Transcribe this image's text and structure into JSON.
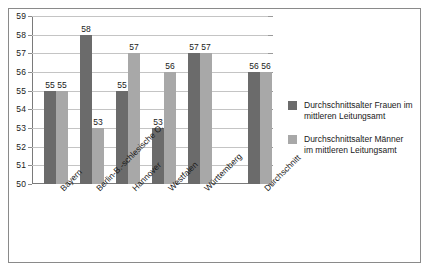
{
  "chart_data": {
    "type": "bar",
    "title": "",
    "xlabel": "",
    "ylabel": "",
    "ylim": [
      50,
      59
    ],
    "yticks": [
      50,
      51,
      52,
      53,
      54,
      55,
      56,
      57,
      58,
      59
    ],
    "grid": true,
    "legend_position": "right",
    "categories": [
      "Bayern",
      "Berlin-B.-schlesische O.",
      "Hannover",
      "Westfalen",
      "Württemberg",
      "Durchschnitt"
    ],
    "series": [
      {
        "name": "Durchschnittsalter Frauen im mittleren Leitungsamt",
        "color": "#6b6b6b",
        "values": [
          55,
          58,
          55,
          53,
          57,
          56
        ]
      },
      {
        "name": "Durchschnittsalter Männer im mittleren Leitungsamt",
        "color": "#a8a8a8",
        "values": [
          55,
          53,
          57,
          56,
          57,
          56
        ]
      }
    ]
  },
  "legend": {
    "entries": [
      {
        "label": "Durchschnittsalter Frauen im mittleren Leitungsamt",
        "swatch": "frauen"
      },
      {
        "label": "Durchschnittsalter Männer im mittleren Leitungsamt",
        "swatch": "maenner"
      }
    ]
  }
}
